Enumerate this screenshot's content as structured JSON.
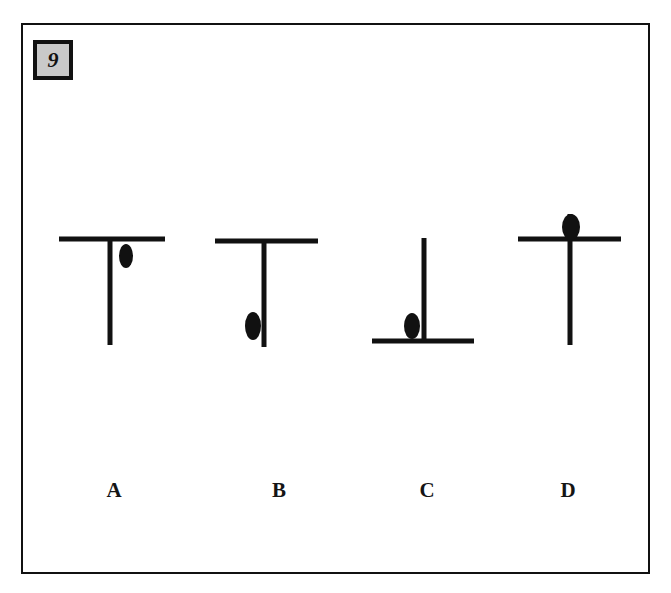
{
  "plate": {
    "number": "9",
    "background_color": "#ffffff",
    "ink_color": "#111111",
    "badge_fill_color": "#c9c9c9",
    "frame": {
      "x": 21,
      "y": 23,
      "width": 629,
      "height": 551
    }
  },
  "chart_data": {
    "type": "diagram",
    "title": "9",
    "xlabel": "",
    "ylabel": "",
    "grid": false,
    "legend": null,
    "categories": [
      "A",
      "B",
      "C",
      "D"
    ],
    "items": [
      {
        "label": "A",
        "label_x": 112,
        "label_y": 478,
        "shape": "T (bar on top of stem)",
        "bar": {
          "x1": 57,
          "y1": 237,
          "x2": 163,
          "y2": 237,
          "thickness": 5,
          "orientation": "horizontal",
          "position": "top"
        },
        "stem": {
          "x1": 108,
          "y1": 237,
          "x2": 108,
          "y2": 343,
          "thickness": 5,
          "orientation": "vertical"
        },
        "ellipse": {
          "cx": 124,
          "cy": 254,
          "rx": 7,
          "ry": 12,
          "side": "right of stem, just below bar"
        }
      },
      {
        "label": "B",
        "label_x": 277,
        "label_y": 478,
        "shape": "T (bar on top of stem)",
        "bar": {
          "x1": 213,
          "y1": 239,
          "x2": 316,
          "y2": 239,
          "thickness": 5,
          "orientation": "horizontal",
          "position": "top"
        },
        "stem": {
          "x1": 262,
          "y1": 239,
          "x2": 262,
          "y2": 345,
          "thickness": 5,
          "orientation": "vertical"
        },
        "ellipse": {
          "cx": 251,
          "cy": 324,
          "rx": 8,
          "ry": 14,
          "side": "left of stem, near bottom"
        }
      },
      {
        "label": "C",
        "label_x": 425,
        "label_y": 478,
        "shape": "inverted T (bar at bottom of stem)",
        "bar": {
          "x1": 370,
          "y1": 339,
          "x2": 472,
          "y2": 339,
          "thickness": 5,
          "orientation": "horizontal",
          "position": "bottom"
        },
        "stem": {
          "x1": 422,
          "y1": 236,
          "x2": 422,
          "y2": 339,
          "thickness": 5,
          "orientation": "vertical"
        },
        "ellipse": {
          "cx": 410,
          "cy": 324,
          "rx": 8,
          "ry": 13,
          "side": "left of stem, sitting on bar"
        }
      },
      {
        "label": "D",
        "label_x": 566,
        "label_y": 478,
        "shape": "cross (stem extends above bar)",
        "bar": {
          "x1": 516,
          "y1": 237,
          "x2": 619,
          "y2": 237,
          "thickness": 5,
          "orientation": "horizontal",
          "position": "upper"
        },
        "stem": {
          "x1": 568,
          "y1": 212,
          "x2": 568,
          "y2": 343,
          "thickness": 5,
          "orientation": "vertical"
        },
        "ellipse": {
          "cx": 569,
          "cy": 225,
          "rx": 9,
          "ry": 13,
          "side": "on stem, above bar"
        }
      }
    ]
  }
}
